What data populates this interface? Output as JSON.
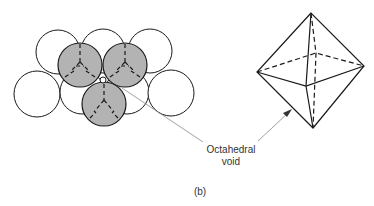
{
  "figure": {
    "panel_label": "(b)",
    "callout": {
      "line1": "Octahedral",
      "line2": "void"
    },
    "colors": {
      "shaded_sphere": "#b3b3b3",
      "outline": "#1a1a1a",
      "leader": "#888888"
    },
    "left_diagram": "close-packed spheres: two layers, three shaded upper-layer spheres over lower layer, octahedral void at center",
    "right_diagram": "octahedron with dashed hidden edges"
  }
}
